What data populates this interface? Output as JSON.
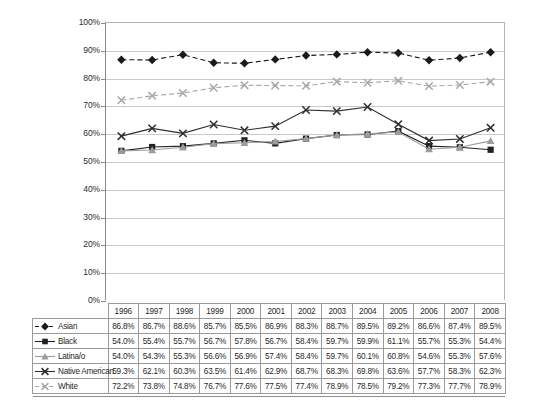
{
  "chart_data": {
    "type": "line",
    "title": "",
    "subtitle": "",
    "xlabel": "",
    "ylabel": "",
    "ylim": [
      0,
      100
    ],
    "ytick_labels": [
      "100%",
      "90%",
      "80%",
      "70%",
      "60%",
      "50%",
      "40%",
      "30%",
      "20%",
      "10%",
      "0%"
    ],
    "ytick_values": [
      100,
      90,
      80,
      70,
      60,
      50,
      40,
      30,
      20,
      10,
      0
    ],
    "grid": "horizontal",
    "legend_position": "table-left-column",
    "categories": [
      "1996",
      "1997",
      "1998",
      "1999",
      "2000",
      "2001",
      "2002",
      "2003",
      "2004",
      "2005",
      "2006",
      "2007",
      "2008"
    ],
    "series": [
      {
        "name": "Asian",
        "marker": "filled-diamond",
        "line_style": "dashed",
        "color": "#1a1a1a",
        "values": [
          86.8,
          86.7,
          88.6,
          85.7,
          85.5,
          86.9,
          88.3,
          88.7,
          89.5,
          89.2,
          86.6,
          87.4,
          89.5
        ],
        "labels": [
          "86.8%",
          "86.7%",
          "88.6%",
          "85.7%",
          "85.5%",
          "86.9%",
          "88.3%",
          "88.7%",
          "89.5%",
          "89.2%",
          "86.6%",
          "87.4%",
          "89.5%"
        ]
      },
      {
        "name": "Black",
        "marker": "filled-square",
        "line_style": "solid",
        "color": "#222222",
        "values": [
          54.0,
          55.4,
          55.7,
          56.7,
          57.8,
          56.7,
          58.4,
          59.7,
          59.9,
          61.1,
          55.7,
          55.3,
          54.4
        ],
        "labels": [
          "54.0%",
          "55.4%",
          "55.7%",
          "56.7%",
          "57.8%",
          "56.7%",
          "58.4%",
          "59.7%",
          "59.9%",
          "61.1%",
          "55.7%",
          "55.3%",
          "54.4%"
        ]
      },
      {
        "name": "Latina/o",
        "marker": "triangle",
        "line_style": "solid",
        "color": "#9c9c9c",
        "values": [
          54.0,
          54.3,
          55.3,
          56.6,
          56.9,
          57.4,
          58.4,
          59.7,
          60.1,
          60.8,
          54.6,
          55.3,
          57.6
        ],
        "labels": [
          "54.0%",
          "54.3%",
          "55.3%",
          "56.6%",
          "56.9%",
          "57.4%",
          "58.4%",
          "59.7%",
          "60.1%",
          "60.8%",
          "54.6%",
          "55.3%",
          "57.6%"
        ]
      },
      {
        "name": "Native American",
        "marker": "cross-x",
        "line_style": "solid",
        "color": "#2e2e2e",
        "values": [
          59.3,
          62.1,
          60.3,
          63.5,
          61.4,
          62.9,
          68.7,
          68.3,
          69.8,
          63.6,
          57.7,
          58.3,
          62.3
        ],
        "labels": [
          "59.3%",
          "62.1%",
          "60.3%",
          "63.5%",
          "61.4%",
          "62.9%",
          "68.7%",
          "68.3%",
          "69.8%",
          "63.6%",
          "57.7%",
          "58.3%",
          "62.3%"
        ]
      },
      {
        "name": "White",
        "marker": "cross-x",
        "line_style": "dashed",
        "color": "#a8a8a8",
        "values": [
          72.2,
          73.8,
          74.8,
          76.7,
          77.6,
          77.5,
          77.4,
          78.9,
          78.5,
          79.2,
          77.3,
          77.7,
          78.9
        ],
        "labels": [
          "72.2%",
          "73.8%",
          "74.8%",
          "76.7%",
          "77.6%",
          "77.5%",
          "77.4%",
          "78.9%",
          "78.5%",
          "79.2%",
          "77.3%",
          "77.7%",
          "78.9%"
        ]
      }
    ]
  },
  "table": {
    "corner_label": "",
    "header": [
      "1996",
      "1997",
      "1998",
      "1999",
      "2000",
      "2001",
      "2002",
      "2003",
      "2004",
      "2005",
      "2006",
      "2007",
      "2008"
    ],
    "rows": [
      {
        "label": "Asian",
        "cells": [
          "86.8%",
          "86.7%",
          "88.6%",
          "85.7%",
          "85.5%",
          "86.9%",
          "88.3%",
          "88.7%",
          "89.5%",
          "89.2%",
          "86.6%",
          "87.4%",
          "89.5%"
        ]
      },
      {
        "label": "Black",
        "cells": [
          "54.0%",
          "55.4%",
          "55.7%",
          "56.7%",
          "57.8%",
          "56.7%",
          "58.4%",
          "59.7%",
          "59.9%",
          "61.1%",
          "55.7%",
          "55.3%",
          "54.4%"
        ]
      },
      {
        "label": "Latina/o",
        "cells": [
          "54.0%",
          "54.3%",
          "55.3%",
          "56.6%",
          "56.9%",
          "57.4%",
          "58.4%",
          "59.7%",
          "60.1%",
          "60.8%",
          "54.6%",
          "55.3%",
          "57.6%"
        ]
      },
      {
        "label": "Native American",
        "cells": [
          "59.3%",
          "62.1%",
          "60.3%",
          "63.5%",
          "61.4%",
          "62.9%",
          "68.7%",
          "68.3%",
          "69.8%",
          "63.6%",
          "57.7%",
          "58.3%",
          "62.3%"
        ]
      },
      {
        "label": "White",
        "cells": [
          "72.2%",
          "73.8%",
          "74.8%",
          "76.7%",
          "77.6%",
          "77.5%",
          "77.4%",
          "78.9%",
          "78.5%",
          "79.2%",
          "77.3%",
          "77.7%",
          "78.9%"
        ]
      }
    ]
  },
  "colors": {
    "axis": "#8a8a8a",
    "gridline": "#c9c9c9",
    "table_border": "#9a9a9a",
    "text": "#1a1a1a"
  }
}
